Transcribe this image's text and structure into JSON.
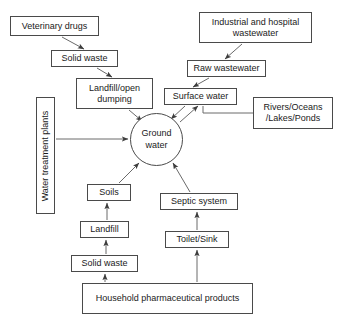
{
  "diagram": {
    "type": "flow-diagram",
    "background_color": "#ffffff",
    "line_color": "#4a4a4a",
    "text_color": "#1a1a1a",
    "nodes": [
      {
        "id": "veterinary_drugs",
        "label": "Veterinary drugs",
        "shape": "rect",
        "x": 10,
        "y": 16,
        "w": 89,
        "h": 20
      },
      {
        "id": "solid_waste_top",
        "label": "Solid waste",
        "shape": "rect",
        "x": 51,
        "y": 50,
        "w": 67,
        "h": 17
      },
      {
        "id": "landfill_open_dumping",
        "label": "Landfill/open dumping",
        "shape": "rect",
        "x": 76,
        "y": 78,
        "w": 77,
        "h": 31
      },
      {
        "id": "water_treatment_plants",
        "label": "Water treatment plants",
        "shape": "rect-vertical",
        "x": 36,
        "y": 97,
        "w": 19,
        "h": 117
      },
      {
        "id": "industrial_hospital_wastewater",
        "label": "Industrial and hospital wastewater",
        "shape": "rect",
        "x": 199,
        "y": 12,
        "w": 113,
        "h": 31
      },
      {
        "id": "raw_wastewater",
        "label": "Raw wastewater",
        "shape": "rect",
        "x": 187,
        "y": 60,
        "w": 79,
        "h": 17
      },
      {
        "id": "surface_water",
        "label": "Surface water",
        "shape": "rect",
        "x": 164,
        "y": 88,
        "w": 73,
        "h": 17
      },
      {
        "id": "rivers_oceans_lakes_ponds",
        "label": "Rivers/Oceans /Lakes/Ponds",
        "shape": "rect",
        "x": 253,
        "y": 97,
        "w": 80,
        "h": 32
      },
      {
        "id": "ground_water",
        "label": "Ground water",
        "shape": "circle",
        "x": 130,
        "y": 113,
        "w": 53,
        "h": 53
      },
      {
        "id": "soils",
        "label": "Soils",
        "shape": "rect",
        "x": 87,
        "y": 184,
        "w": 44,
        "h": 17
      },
      {
        "id": "landfill",
        "label": "Landfill",
        "shape": "rect",
        "x": 80,
        "y": 221,
        "w": 49,
        "h": 17
      },
      {
        "id": "solid_waste_bottom",
        "label": "Solid waste",
        "shape": "rect",
        "x": 71,
        "y": 255,
        "w": 67,
        "h": 17
      },
      {
        "id": "septic_system",
        "label": "Septic system",
        "shape": "rect",
        "x": 160,
        "y": 193,
        "w": 78,
        "h": 17
      },
      {
        "id": "toilet_sink",
        "label": "Toilet/Sink",
        "shape": "rect",
        "x": 165,
        "y": 231,
        "w": 64,
        "h": 17
      },
      {
        "id": "household_pharmaceutical_products",
        "label": "Household pharmaceutical products",
        "shape": "rect",
        "x": 82,
        "y": 283,
        "w": 171,
        "h": 31
      }
    ],
    "edges": [
      {
        "id": "edge-veterinary-to-solidwaste",
        "from": "veterinary_drugs",
        "to": "solid_waste_top",
        "arrow": "single"
      },
      {
        "id": "edge-solidwaste-to-landfillopen",
        "from": "solid_waste_top",
        "to": "landfill_open_dumping",
        "arrow": "single"
      },
      {
        "id": "edge-landfillopen-to-groundwater",
        "from": "landfill_open_dumping",
        "to": "ground_water",
        "arrow": "single"
      },
      {
        "id": "edge-watertreatment-to-groundwater",
        "from": "water_treatment_plants",
        "to": "ground_water",
        "arrow": "single"
      },
      {
        "id": "edge-industrial-to-rawwastewater",
        "from": "industrial_hospital_wastewater",
        "to": "raw_wastewater",
        "arrow": "single"
      },
      {
        "id": "edge-rawwastewater-to-surfacewater",
        "from": "raw_wastewater",
        "to": "surface_water",
        "arrow": "single"
      },
      {
        "id": "edge-surfacewater-to-groundwater",
        "from": "surface_water",
        "to": "ground_water",
        "arrow": "single"
      },
      {
        "id": "edge-groundwater-to-surfacewater",
        "from": "ground_water",
        "to": "surface_water",
        "arrow": "single"
      },
      {
        "id": "edge-rivers-to-surfacewater",
        "from": "rivers_oceans_lakes_ponds",
        "to": "surface_water",
        "arrow": "none"
      },
      {
        "id": "edge-soils-to-groundwater",
        "from": "soils",
        "to": "ground_water",
        "arrow": "single"
      },
      {
        "id": "edge-landfill-to-soils",
        "from": "landfill",
        "to": "soils",
        "arrow": "single"
      },
      {
        "id": "edge-solidwastebottom-to-landfill",
        "from": "solid_waste_bottom",
        "to": "landfill",
        "arrow": "single"
      },
      {
        "id": "edge-household-to-solidwastebottom",
        "from": "household_pharmaceutical_products",
        "to": "solid_waste_bottom",
        "arrow": "single"
      },
      {
        "id": "edge-household-to-toiletsink",
        "from": "household_pharmaceutical_products",
        "to": "toilet_sink",
        "arrow": "single"
      },
      {
        "id": "edge-toiletsink-to-septicsystem",
        "from": "toilet_sink",
        "to": "septic_system",
        "arrow": "single"
      },
      {
        "id": "edge-septicsystem-to-groundwater",
        "from": "septic_system",
        "to": "ground_water",
        "arrow": "single"
      }
    ]
  }
}
